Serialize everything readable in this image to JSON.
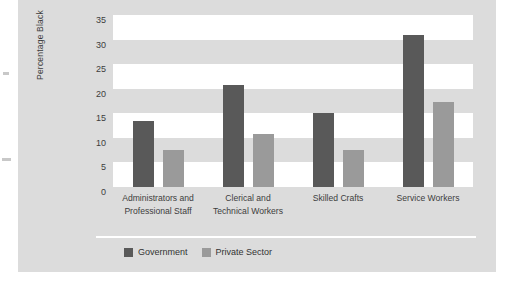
{
  "chart_data": {
    "type": "bar",
    "title": "",
    "subtitle": "",
    "xlabel": "",
    "ylabel": "Percentage Black",
    "ylim": [
      0,
      35
    ],
    "yticks": [
      0,
      5,
      10,
      15,
      20,
      25,
      30,
      35
    ],
    "ytick_labels": [
      "0",
      "5",
      "10",
      "15",
      "20",
      "25",
      "30",
      "35"
    ],
    "grid": "alternating horizontal bands",
    "legend_position": "bottom-left",
    "categories": [
      "Administrators and Professional Staff",
      "Clerical and Technical Workers",
      "Skilled Crafts",
      "Service Workers"
    ],
    "category_lines": [
      [
        "Administrators and",
        "Professional Staff"
      ],
      [
        "Clerical and",
        "Technical Workers"
      ],
      [
        "Skilled Crafts"
      ],
      [
        "Service Workers"
      ]
    ],
    "series": [
      {
        "name": "Government",
        "color": "#595959",
        "values": [
          13.5,
          20.8,
          15.0,
          31.0
        ]
      },
      {
        "name": "Private Sector",
        "color": "#9a9a9a",
        "values": [
          7.5,
          10.7,
          7.5,
          17.3
        ]
      }
    ]
  },
  "colors": {
    "panel_background": "#dcdcdc",
    "band_light": "#ffffff",
    "government": "#595959",
    "private_sector": "#9a9a9a",
    "text": "#3c3c3c"
  }
}
